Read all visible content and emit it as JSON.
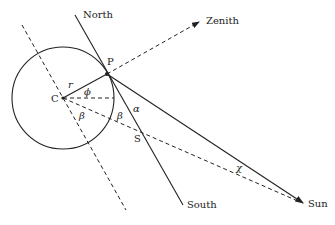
{
  "diagram": {
    "labels": {
      "north": "North",
      "south": "South",
      "zenith": "Zenith",
      "sun": "Sun",
      "point_p": "P",
      "point_c": "C",
      "point_s": "S",
      "radius": "r",
      "phi": "ϕ",
      "alpha": "α",
      "beta_left": "β",
      "beta_right": "β",
      "chi": "χ"
    },
    "colors": {
      "stroke": "#222222",
      "background": "#ffffff"
    }
  }
}
